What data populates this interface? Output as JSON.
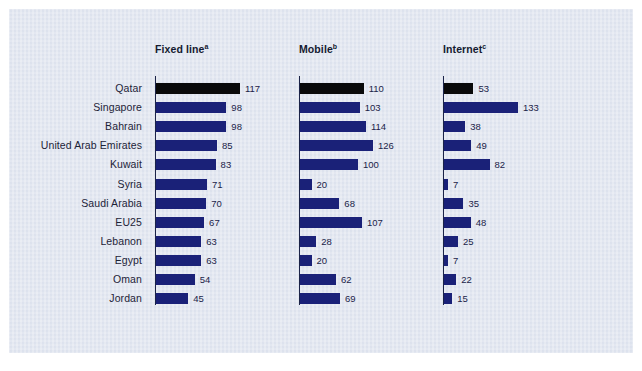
{
  "chart_data": {
    "type": "bar",
    "title": "",
    "subtitle": "",
    "xlabel": "",
    "ylabel": "",
    "orientation": "horizontal",
    "grid": false,
    "legend": "none",
    "categories": [
      "Qatar",
      "Singapore",
      "Bahrain",
      "United Arab Emirates",
      "Kuwait",
      "Syria",
      "Saudi Arabia",
      "EU25",
      "Lebanon",
      "Egypt",
      "Oman",
      "Jordan"
    ],
    "highlight_category": "Qatar",
    "panels": [
      {
        "name": "fixed-line",
        "label": "Fixed line",
        "footnote_marker": "a",
        "values": [
          117,
          98,
          98,
          85,
          83,
          71,
          70,
          67,
          63,
          63,
          54,
          45
        ],
        "xlim": [
          0,
          117
        ]
      },
      {
        "name": "mobile",
        "label": "Mobile",
        "footnote_marker": "b",
        "values": [
          110,
          103,
          114,
          126,
          100,
          20,
          68,
          107,
          28,
          20,
          62,
          69
        ],
        "xlim": [
          0,
          126
        ]
      },
      {
        "name": "internet",
        "label": "Internet",
        "footnote_marker": "c",
        "values": [
          53,
          133,
          38,
          49,
          82,
          7,
          35,
          48,
          25,
          7,
          22,
          15
        ],
        "xlim": [
          0,
          133
        ]
      }
    ],
    "series": [
      {
        "name": "Fixed line",
        "values": [
          117,
          98,
          98,
          85,
          83,
          71,
          70,
          67,
          63,
          63,
          54,
          45
        ]
      },
      {
        "name": "Mobile",
        "values": [
          110,
          103,
          114,
          126,
          100,
          20,
          68,
          107,
          28,
          20,
          62,
          69
        ]
      },
      {
        "name": "Internet",
        "values": [
          53,
          133,
          38,
          49,
          82,
          7,
          35,
          48,
          25,
          7,
          22,
          15
        ]
      }
    ]
  },
  "colors": {
    "background": "#d6dcea",
    "page": "#ffffff",
    "bar": "#1a2178",
    "bar_highlight": "#0a0a0a",
    "text": "#1b2348"
  },
  "layout": {
    "panel_x": [
      146,
      290,
      434
    ],
    "panel_scale": [
      0.718,
      0.579,
      0.556
    ],
    "row_top": 70,
    "row_pitch": 19.1
  }
}
